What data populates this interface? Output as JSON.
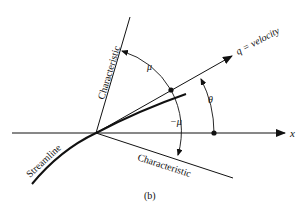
{
  "figure": {
    "caption": "(b)",
    "labels": {
      "x_axis": "x",
      "velocity": "q = velocity",
      "characteristic_upper": "Characteristic",
      "characteristic_lower": "Characteristic",
      "streamline": "Streamline",
      "mu": "μ",
      "minus_mu": "−μ",
      "theta": "θ"
    },
    "colors": {
      "stroke": "#111111",
      "background": "#ffffff"
    }
  }
}
